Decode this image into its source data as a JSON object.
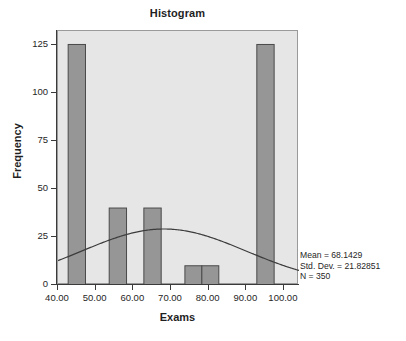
{
  "chart_data": {
    "type": "bar",
    "title": "Histogram",
    "xlabel": "Exams",
    "ylabel": "Frequency",
    "xlim": [
      40,
      104
    ],
    "ylim": [
      0,
      132
    ],
    "grid": false,
    "legend": null,
    "x_ticks": [
      40,
      50,
      60,
      70,
      80,
      90,
      100
    ],
    "x_tick_labels": [
      "40.00",
      "50.00",
      "60.00",
      "70.00",
      "80.00",
      "90.00",
      "100.00"
    ],
    "y_ticks": [
      0,
      25,
      50,
      75,
      100,
      125
    ],
    "y_tick_labels": [
      "0",
      "25",
      "50",
      "75",
      "100",
      "125"
    ],
    "bar_color": "#969696",
    "bar_edge_color": "#4a4a4a",
    "plot_background": "#e6e6e6",
    "curve_color": "#3c3c3c",
    "bins": [
      {
        "x0": 42.7,
        "x1": 47.3,
        "value": 125
      },
      {
        "x0": 53.6,
        "x1": 58.2,
        "value": 40
      },
      {
        "x0": 62.8,
        "x1": 67.4,
        "value": 40
      },
      {
        "x0": 73.7,
        "x1": 78.2,
        "value": 10
      },
      {
        "x0": 78.2,
        "x1": 82.7,
        "value": 10
      },
      {
        "x0": 92.8,
        "x1": 97.4,
        "value": 125
      }
    ],
    "normal_curve": {
      "mean": 68.1429,
      "std_dev": 21.82851,
      "n": 350,
      "bin_width": 4.55,
      "peak_value": 32
    },
    "annotations": {
      "mean": "Mean = 68.1429",
      "std_dev": "Std. Dev. = 21.82851",
      "n": "N = 350"
    }
  }
}
